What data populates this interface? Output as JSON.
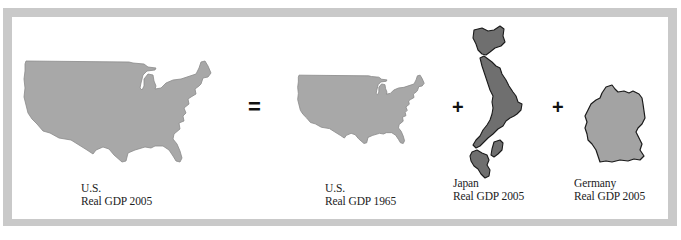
{
  "figure": {
    "colors": {
      "frame": "#c9c9c9",
      "background": "#ffffff",
      "us_fill": "#a8a8a8",
      "us_stroke": "#8a8a8a",
      "japan_fill": "#6f6f6f",
      "japan_stroke": "#1a1a1a",
      "germany_fill": "#a3a3a3",
      "germany_stroke": "#1a1a1a",
      "operator": "#111111",
      "text": "#222222"
    },
    "operators": {
      "equals": "=",
      "plus_1": "+",
      "plus_2": "+"
    },
    "panels": [
      {
        "id": "us-2005",
        "shape": "us-map",
        "label_line1": "U.S.",
        "label_line2": "Real GDP 2005"
      },
      {
        "id": "us-1965",
        "shape": "us-map",
        "label_line1": "U.S.",
        "label_line2": "Real GDP 1965"
      },
      {
        "id": "japan-2005",
        "shape": "japan-map",
        "label_line1": "Japan",
        "label_line2": "Real GDP 2005"
      },
      {
        "id": "germany-2005",
        "shape": "germany-map",
        "label_line1": "Germany",
        "label_line2": "Real GDP 2005"
      }
    ]
  }
}
